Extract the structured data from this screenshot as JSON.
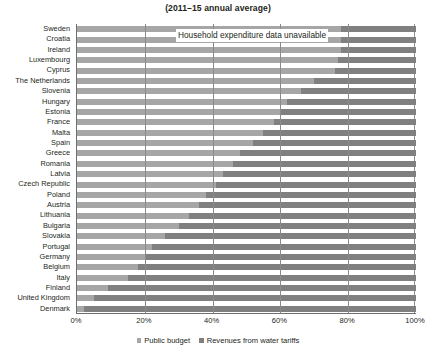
{
  "chart_data": {
    "type": "bar",
    "orientation": "horizontal",
    "stacked": true,
    "title": "(2011–15 annual average)",
    "xlabel": "",
    "ylabel": "",
    "xlim": [
      0,
      100
    ],
    "xticks": [
      0,
      20,
      40,
      60,
      80,
      100
    ],
    "xtick_labels": [
      "0%",
      "20%",
      "40%",
      "60%",
      "80%",
      "100%"
    ],
    "grid": true,
    "legend_position": "bottom",
    "annotation": "Household expenditure data unavailable",
    "categories": [
      "Sweden",
      "Croatia",
      "Ireland",
      "Luxembourg",
      "Cyprus",
      "The Netherlands",
      "Slovenia",
      "Hungary",
      "Estonia",
      "France",
      "Malta",
      "Spain",
      "Greece",
      "Romania",
      "Latvia",
      "Czech Republic",
      "Poland",
      "Austria",
      "Lithuania",
      "Bulgaria",
      "Slovakia",
      "Portugal",
      "Germany",
      "Belgium",
      "Italy",
      "Finland",
      "United Kingdom",
      "Denmark"
    ],
    "series": [
      {
        "name": "Public budget",
        "color": "#a6a6a6",
        "values": [
          78,
          78,
          78,
          77,
          76,
          70,
          66,
          62,
          60,
          58,
          55,
          52,
          48,
          46,
          43,
          41,
          38,
          36,
          33,
          30,
          26,
          22,
          20,
          18,
          15,
          9,
          5,
          2
        ]
      },
      {
        "name": "Revenues from water tariffs",
        "color": "#808080",
        "values": [
          22,
          22,
          22,
          23,
          24,
          30,
          34,
          38,
          40,
          42,
          45,
          48,
          52,
          54,
          57,
          59,
          62,
          64,
          67,
          70,
          74,
          78,
          80,
          82,
          85,
          91,
          95,
          98
        ]
      }
    ]
  },
  "legend": {
    "items": [
      {
        "label": "Public budget"
      },
      {
        "label": "Revenues from water tariffs"
      }
    ]
  }
}
